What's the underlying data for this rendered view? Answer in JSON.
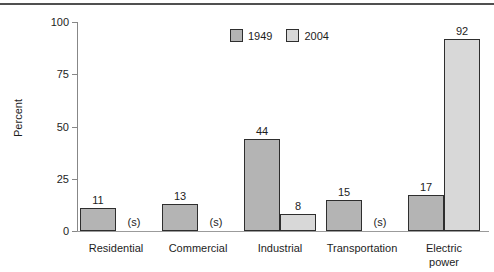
{
  "chart_data": {
    "type": "bar",
    "title": "",
    "ylabel": "Percent",
    "ylim": [
      0,
      100
    ],
    "yticks": [
      0,
      25,
      50,
      75,
      100
    ],
    "grid": false,
    "legend_position": "top",
    "axis_color": "#878787",
    "bar_border_color": "#2e2e2e",
    "categories": [
      "Residential",
      "Commercial",
      "Industrial",
      "Transportation",
      "Electric\npower"
    ],
    "series": [
      {
        "name": "1949",
        "color": "#b4b4b4",
        "values": [
          11,
          13,
          44,
          15,
          17
        ],
        "labels": [
          "11",
          "13",
          "44",
          "15",
          "17"
        ]
      },
      {
        "name": "2004",
        "color": "#d8d8d8",
        "values": [
          null,
          null,
          8,
          null,
          92
        ],
        "labels": [
          "(s)",
          "(s)",
          "8",
          "(s)",
          "92"
        ]
      }
    ]
  }
}
